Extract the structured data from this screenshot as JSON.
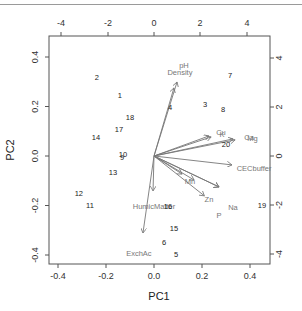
{
  "chart_data": {
    "type": "scatter",
    "subtype": "biplot",
    "title": "",
    "xlabel": "PC1",
    "ylabel": "PC2",
    "xlim": [
      -0.44,
      0.48
    ],
    "ylim": [
      -0.44,
      0.48
    ],
    "x_ticks": [
      "-0.4",
      "-0.2",
      "0.0",
      "0.2",
      "0.4"
    ],
    "y_ticks": [
      "-0.4",
      "-0.2",
      "0.0",
      "0.2",
      "0.4"
    ],
    "x_tick_values": [
      -0.4,
      -0.2,
      0.0,
      0.2,
      0.4
    ],
    "y_tick_values": [
      -0.4,
      -0.2,
      0.0,
      0.2,
      0.4
    ],
    "top_ticks": [
      "-4",
      "-2",
      "0",
      "2",
      "4"
    ],
    "right_ticks": [
      "4",
      "2",
      "0",
      "-2",
      "-4"
    ],
    "grid": false,
    "legend": null,
    "observations": [
      {
        "label": "1",
        "pc1": -0.142,
        "pc2": 0.246
      },
      {
        "label": "2",
        "pc1": -0.238,
        "pc2": 0.319
      },
      {
        "label": "3",
        "pc1": 0.213,
        "pc2": 0.21
      },
      {
        "label": "4",
        "pc1": 0.067,
        "pc2": 0.198
      },
      {
        "label": "5",
        "pc1": 0.092,
        "pc2": -0.396
      },
      {
        "label": "6",
        "pc1": 0.042,
        "pc2": -0.347
      },
      {
        "label": "7",
        "pc1": 0.317,
        "pc2": 0.327
      },
      {
        "label": "8",
        "pc1": 0.288,
        "pc2": 0.19
      },
      {
        "label": "9",
        "pc1": -0.133,
        "pc2": -0.004
      },
      {
        "label": "10",
        "pc1": -0.129,
        "pc2": 0.008
      },
      {
        "label": "11",
        "pc1": -0.267,
        "pc2": -0.198
      },
      {
        "label": "12",
        "pc1": -0.313,
        "pc2": -0.149
      },
      {
        "label": "13",
        "pc1": -0.171,
        "pc2": -0.065
      },
      {
        "label": "14",
        "pc1": -0.242,
        "pc2": 0.077
      },
      {
        "label": "15",
        "pc1": 0.083,
        "pc2": -0.291
      },
      {
        "label": "16",
        "pc1": 0.058,
        "pc2": -0.202
      },
      {
        "label": "17",
        "pc1": -0.146,
        "pc2": 0.109
      },
      {
        "label": "18",
        "pc1": -0.1,
        "pc2": 0.158
      },
      {
        "label": "19",
        "pc1": 0.45,
        "pc2": -0.198
      },
      {
        "label": "20",
        "pc1": 0.3,
        "pc2": 0.048
      }
    ],
    "loadings": [
      {
        "label": "pH",
        "pc1": 0.096,
        "pc2": 0.299,
        "label_pos": [
          0.125,
          0.366
        ]
      },
      {
        "label": "Density",
        "pc1": 0.083,
        "pc2": 0.275,
        "label_pos": [
          0.108,
          0.338
        ]
      },
      {
        "label": "Cu",
        "pc1": 0.229,
        "pc2": 0.081,
        "label_pos": [
          0.279,
          0.097
        ]
      },
      {
        "label": "K",
        "pc1": 0.238,
        "pc2": 0.077,
        "label_pos": [
          0.283,
          0.089
        ]
      },
      {
        "label": "Ca",
        "pc1": 0.329,
        "pc2": 0.069,
        "label_pos": [
          0.396,
          0.077
        ]
      },
      {
        "label": "Mg",
        "pc1": 0.338,
        "pc2": 0.065,
        "label_pos": [
          0.41,
          0.073
        ]
      },
      {
        "label": "CECbuffer",
        "pc1": 0.325,
        "pc2": -0.036,
        "label_pos": [
          0.417,
          -0.048
        ]
      },
      {
        "label": "Mn",
        "pc1": 0.117,
        "pc2": -0.073,
        "label_pos": [
          0.15,
          -0.101
        ]
      },
      {
        "label": "Mn2",
        "pc1": 0.167,
        "pc2": -0.097,
        "label_pos": null
      },
      {
        "label": "Zn",
        "pc1": 0.271,
        "pc2": -0.125,
        "label_pos": [
          0.229,
          -0.174
        ]
      },
      {
        "label": "Na",
        "pc1": 0.271,
        "pc2": -0.125,
        "label_pos": [
          0.329,
          -0.206
        ]
      },
      {
        "label": "P",
        "pc1": 0.21,
        "pc2": -0.161,
        "label_pos": [
          0.271,
          -0.238
        ]
      },
      {
        "label": "HumicMatter",
        "pc1": -0.004,
        "pc2": -0.141,
        "label_pos": [
          0.0,
          -0.202
        ]
      },
      {
        "label": "ExchAc",
        "pc1": -0.046,
        "pc2": -0.311,
        "label_pos": [
          -0.063,
          -0.392
        ]
      }
    ],
    "colors": {
      "observations": "#222222",
      "loadings": "#777777",
      "axes": "#555555"
    }
  }
}
